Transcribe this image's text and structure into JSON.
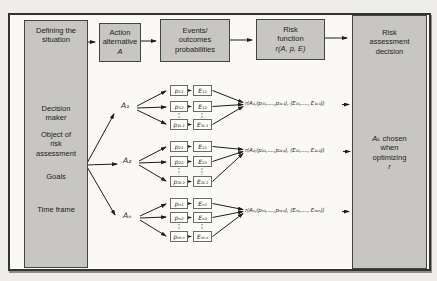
{
  "figure": {
    "left_box": {
      "title": "Defining the\nsituation",
      "items": [
        "Decision\nmaker",
        "Object of\nrisk\nassessment",
        "Goals",
        "Time frame"
      ]
    },
    "action_box": {
      "line1": "Action",
      "line2": "alternative",
      "line3": "A"
    },
    "events_box": {
      "label": "Events/\noutcomes\nprobabilities"
    },
    "risk_function_box": {
      "line1": "Risk",
      "line2": "function",
      "line3": "r(A, p, E)"
    },
    "decision_box": {
      "title": "Risk\nassessment\ndecision",
      "chosen_a": "Aₖ",
      "chosen_rest": " chosen",
      "line2": "when",
      "line3": "optimizing",
      "line4": "r"
    },
    "tree": {
      "rows": [
        {
          "action": "A₁",
          "probs": [
            "p₁₁",
            "p₁₂",
            "p₁ₖ₁"
          ],
          "events": [
            "E₁₁",
            "E₁₂",
            "E₁ₖ₁"
          ],
          "formula": "r(A₁,(p₁₁,....,p₁ₖ₁), (E₁₁,...., E₁ₖ₁))"
        },
        {
          "action": "A₂",
          "probs": [
            "p₂₁",
            "p₂₂",
            "p₂ₖ₂"
          ],
          "events": [
            "E₂₁",
            "E₂₂",
            "E₂ₖ₂"
          ],
          "formula": "r(A₂,(p₂₁,....,p₂ₖ₂), (E₂₁,...., E₂ₖ₂))"
        },
        {
          "action": "Aₙ",
          "probs": [
            "pₙ₁",
            "pₙ₂",
            "pₙₖₙ"
          ],
          "events": [
            "Eₙ₁",
            "Eₙ₂",
            "Eₙₖₙ"
          ],
          "formula": "r(Aₙ,(pₙ₁,....,pₙₖₙ), (Eₙ₁,...., Eₙₖₙ))"
        }
      ]
    },
    "colors": {
      "box_fill": "#c7c6c3",
      "box_border": "#45453f",
      "line": "#1d1d1b",
      "paper": "#faf9f6",
      "page": "#eeedea"
    }
  }
}
